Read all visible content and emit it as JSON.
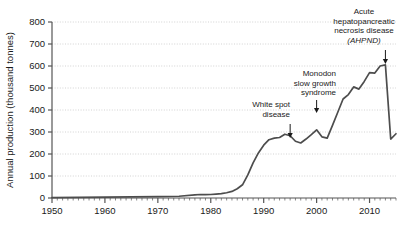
{
  "chart_data": {
    "type": "line",
    "title": "",
    "subtitle": "",
    "xlabel": "",
    "ylabel": "Annual production (thousand tonnes)",
    "xlim": [
      1950,
      2015
    ],
    "ylim": [
      0,
      800
    ],
    "grid": true,
    "legend": "none",
    "x_ticks": [
      1950,
      1960,
      1970,
      1980,
      1990,
      2000,
      2010
    ],
    "x_tick_labels": [
      "1950",
      "1960",
      "1970",
      "1980",
      "1990",
      "2000",
      "2010"
    ],
    "x_minor_tick_step": 1,
    "y_ticks": [
      0,
      100,
      200,
      300,
      400,
      500,
      600,
      700,
      800
    ],
    "y_tick_labels": [
      "0",
      "100",
      "200",
      "300",
      "400",
      "500",
      "600",
      "700",
      "800"
    ],
    "line_color": "#4d4d4d",
    "grid_color": "#c8c8c8",
    "axis_color": "#555555",
    "series": [
      {
        "name": "Annual production",
        "x": [
          1950,
          1955,
          1960,
          1965,
          1970,
          1974,
          1977,
          1978,
          1979,
          1980,
          1981,
          1982,
          1983,
          1984,
          1985,
          1986,
          1987,
          1988,
          1989,
          1990,
          1991,
          1992,
          1993,
          1994,
          1995,
          1996,
          1997,
          1998,
          1999,
          2000,
          2001,
          2002,
          2003,
          2004,
          2005,
          2006,
          2007,
          2008,
          2009,
          2010,
          2011,
          2012,
          2013,
          2014,
          2015
        ],
        "values": [
          2,
          3,
          4,
          5,
          6,
          8,
          14,
          16,
          15,
          16,
          18,
          20,
          24,
          30,
          42,
          60,
          105,
          160,
          205,
          240,
          265,
          272,
          275,
          290,
          283,
          258,
          250,
          268,
          288,
          310,
          278,
          272,
          330,
          390,
          450,
          470,
          505,
          495,
          530,
          570,
          568,
          600,
          605,
          268,
          292
        ]
      }
    ],
    "annotations": [
      {
        "id": "white-spot-disease",
        "lines": [
          "White spot",
          "disease"
        ],
        "italic_lines": [],
        "arrow_x_year": 1995,
        "arrow_target_value": 283
      },
      {
        "id": "monodon-slow-growth-syndrome",
        "lines": [
          "Monodon",
          "slow growth",
          "syndrome"
        ],
        "italic_lines": [],
        "arrow_x_year": 2000,
        "arrow_target_value": 310
      },
      {
        "id": "acute-hepatopancreatic-necrosis-disease",
        "lines": [
          "Acute",
          "hepatopancreatic",
          "necrosis disease",
          "(AHPND)"
        ],
        "italic_lines": [
          "(AHPND)"
        ],
        "arrow_x_year": 2013,
        "arrow_target_value": 605
      }
    ]
  }
}
